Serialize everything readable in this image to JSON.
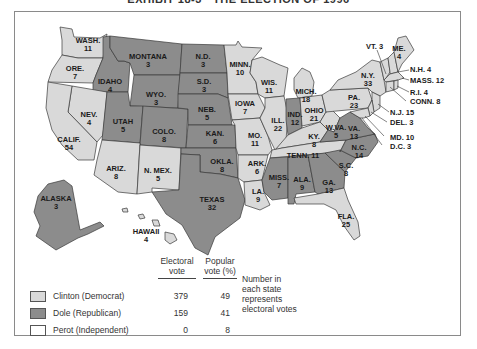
{
  "title": "EXHIBIT 18-3 · THE ELECTION OF 1996",
  "colors": {
    "democrat": "#d9d9d9",
    "republican": "#8c8c8c",
    "independent": "#ffffff",
    "border": "#3a3a3a"
  },
  "legend": {
    "headers": {
      "electoral": "Electoral\nvote",
      "electoral_line1": "Electoral",
      "electoral_line2": "vote",
      "popular_line1": "Popular",
      "popular_line2": "vote (%)"
    },
    "rows": [
      {
        "name": "Clinton (Democrat)",
        "electoral": "379",
        "popular": "49",
        "swatch": "democrat"
      },
      {
        "name": "Dole (Republican)",
        "electoral": "159",
        "popular": "41",
        "swatch": "republican"
      },
      {
        "name": "Perot (Independent)",
        "electoral": "0",
        "popular": "8",
        "swatch": "independent"
      }
    ],
    "note_line1": "Number in",
    "note_line2": "each state",
    "note_line3": "represents",
    "note_line4": "electoral votes"
  },
  "states": {
    "wash": {
      "abbr": "WASH.",
      "votes": "11",
      "party": "D"
    },
    "ore": {
      "abbr": "ORE.",
      "votes": "7",
      "party": "D"
    },
    "calif": {
      "abbr": "CALIF.",
      "votes": "54",
      "party": "D"
    },
    "nev": {
      "abbr": "NEV.",
      "votes": "4",
      "party": "D"
    },
    "idaho": {
      "abbr": "IDAHO",
      "votes": "4",
      "party": "R"
    },
    "montana": {
      "abbr": "MONTANA",
      "votes": "3",
      "party": "R"
    },
    "wyo": {
      "abbr": "WYO.",
      "votes": "3",
      "party": "R"
    },
    "utah": {
      "abbr": "UTAH",
      "votes": "5",
      "party": "R"
    },
    "colo": {
      "abbr": "COLO.",
      "votes": "8",
      "party": "R"
    },
    "ariz": {
      "abbr": "ARIZ.",
      "votes": "8",
      "party": "D"
    },
    "nmex": {
      "abbr": "N. MEX.",
      "votes": "5",
      "party": "D"
    },
    "nd": {
      "abbr": "N.D.",
      "votes": "3",
      "party": "R"
    },
    "sd": {
      "abbr": "S.D.",
      "votes": "3",
      "party": "R"
    },
    "neb": {
      "abbr": "NEB.",
      "votes": "5",
      "party": "R"
    },
    "kan": {
      "abbr": "KAN.",
      "votes": "6",
      "party": "R"
    },
    "okla": {
      "abbr": "OKLA.",
      "votes": "8",
      "party": "R"
    },
    "texas": {
      "abbr": "TEXAS",
      "votes": "32",
      "party": "R"
    },
    "minn": {
      "abbr": "MINN.",
      "votes": "10",
      "party": "D"
    },
    "iowa": {
      "abbr": "IOWA",
      "votes": "7",
      "party": "D"
    },
    "mo": {
      "abbr": "MO.",
      "votes": "11",
      "party": "D"
    },
    "ark": {
      "abbr": "ARK.",
      "votes": "6",
      "party": "D"
    },
    "la": {
      "abbr": "LA.",
      "votes": "9",
      "party": "D"
    },
    "wis": {
      "abbr": "WIS.",
      "votes": "11",
      "party": "D"
    },
    "ill": {
      "abbr": "ILL.",
      "votes": "22",
      "party": "D"
    },
    "mich": {
      "abbr": "MICH.",
      "votes": "18",
      "party": "D"
    },
    "ind": {
      "abbr": "IND.",
      "votes": "12",
      "party": "R"
    },
    "ohio": {
      "abbr": "OHIO",
      "votes": "21",
      "party": "D"
    },
    "ky": {
      "abbr": "KY.",
      "votes": "8",
      "party": "D"
    },
    "tenn": {
      "abbr": "TENN.",
      "votes": "11",
      "party": "D"
    },
    "miss": {
      "abbr": "MISS.",
      "votes": "7",
      "party": "R"
    },
    "ala": {
      "abbr": "ALA.",
      "votes": "9",
      "party": "R"
    },
    "ga": {
      "abbr": "GA.",
      "votes": "13",
      "party": "R"
    },
    "fla": {
      "abbr": "FLA.",
      "votes": "25",
      "party": "D"
    },
    "sc": {
      "abbr": "S.C.",
      "votes": "8",
      "party": "R"
    },
    "nc": {
      "abbr": "N.C.",
      "votes": "14",
      "party": "R"
    },
    "va": {
      "abbr": "VA.",
      "votes": "13",
      "party": "R"
    },
    "wva": {
      "abbr": "W.VA.",
      "votes": "5",
      "party": "D"
    },
    "pa": {
      "abbr": "PA.",
      "votes": "23",
      "party": "D"
    },
    "ny": {
      "abbr": "N.Y.",
      "votes": "33",
      "party": "D"
    },
    "vt": {
      "abbr": "VT.",
      "votes": "3",
      "party": "D",
      "label": "VT. 3"
    },
    "me": {
      "abbr": "ME.",
      "votes": "4",
      "party": "D"
    },
    "nh": {
      "abbr": "N.H.",
      "votes": "4",
      "party": "D",
      "label": "N.H. 4"
    },
    "mass": {
      "abbr": "MASS.",
      "votes": "12",
      "party": "D",
      "label": "MASS. 12"
    },
    "ri": {
      "abbr": "R.I.",
      "votes": "4",
      "party": "D",
      "label": "R.I. 4"
    },
    "conn": {
      "abbr": "CONN.",
      "votes": "8",
      "party": "D",
      "label": "CONN. 8"
    },
    "nj": {
      "abbr": "N.J.",
      "votes": "15",
      "party": "D",
      "label": "N.J. 15"
    },
    "del": {
      "abbr": "DEL.",
      "votes": "3",
      "party": "D",
      "label": "DEL. 3"
    },
    "md": {
      "abbr": "MD.",
      "votes": "10",
      "party": "D",
      "label": "MD. 10"
    },
    "dc": {
      "abbr": "D.C.",
      "votes": "3",
      "party": "D",
      "label": "D.C. 3"
    },
    "alaska": {
      "abbr": "ALASKA",
      "votes": "3",
      "party": "R"
    },
    "hawaii": {
      "abbr": "HAWAII",
      "votes": "4",
      "party": "D"
    }
  }
}
